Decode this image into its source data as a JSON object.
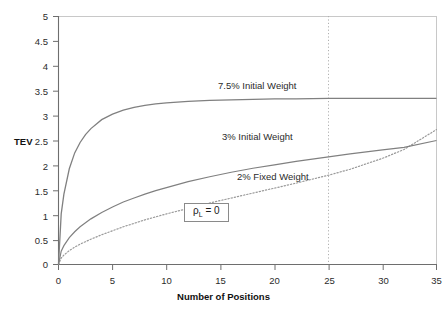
{
  "chart_data": {
    "type": "line",
    "title": "",
    "xlabel": "Number of Positions",
    "ylabel": "TEV",
    "xlim": [
      0,
      35
    ],
    "ylim": [
      0,
      5
    ],
    "xticks": [
      0,
      5,
      10,
      15,
      20,
      25,
      30,
      35
    ],
    "yticks": [
      0,
      0.5,
      1,
      1.5,
      2,
      2.5,
      3,
      3.5,
      4,
      4.5,
      5
    ],
    "xtick_labels": [
      "0",
      "5",
      "10",
      "15",
      "20",
      "25",
      "30",
      "35"
    ],
    "ytick_labels": [
      "0",
      "0.5",
      "1",
      "1.5",
      "2",
      "2.5",
      "3",
      "3.5",
      "4",
      "4.5",
      "5"
    ],
    "grid": false,
    "legend_position": "inline-annotations",
    "line_color": "#808080",
    "frame_color": "#c8c8c8",
    "axis_color": "#6e6e6e",
    "x": [
      0,
      0.25,
      0.5,
      1,
      1.5,
      2,
      2.5,
      3,
      4,
      5,
      6,
      7,
      8,
      9,
      10,
      12,
      14,
      16,
      18,
      20,
      22,
      25,
      27,
      30,
      32,
      35
    ],
    "series": [
      {
        "name": "7.5% Initial Weight",
        "style": "solid",
        "color": "#808080",
        "values": [
          0,
          1.02,
          1.42,
          1.93,
          2.25,
          2.46,
          2.62,
          2.74,
          2.92,
          3.03,
          3.11,
          3.17,
          3.21,
          3.24,
          3.26,
          3.29,
          3.31,
          3.32,
          3.33,
          3.34,
          3.34,
          3.35,
          3.35,
          3.35,
          3.35,
          3.35
        ],
        "annotation": "7.5% Initial Weight",
        "annotation_x": 17.5,
        "annotation_y": 3.55,
        "plateau_value": 3.35
      },
      {
        "name": "3% Initial Weight",
        "style": "solid",
        "color": "#808080",
        "values": [
          0,
          0.27,
          0.38,
          0.54,
          0.66,
          0.76,
          0.84,
          0.92,
          1.05,
          1.16,
          1.26,
          1.34,
          1.42,
          1.49,
          1.55,
          1.67,
          1.77,
          1.86,
          1.94,
          2.01,
          2.08,
          2.17,
          2.23,
          2.31,
          2.36,
          2.5
        ],
        "annotation": "3% Initial Weight",
        "annotation_x": 17.5,
        "annotation_y": 2.62,
        "end_value": 2.5
      },
      {
        "name": "2% Fixed Weight",
        "style": "dotted",
        "color": "#9a9a9a",
        "values": [
          0,
          0.13,
          0.19,
          0.28,
          0.35,
          0.41,
          0.46,
          0.51,
          0.6,
          0.68,
          0.76,
          0.83,
          0.9,
          0.96,
          1.02,
          1.13,
          1.24,
          1.34,
          1.44,
          1.54,
          1.64,
          1.8,
          1.92,
          2.14,
          2.32,
          2.72
        ],
        "annotation": "2% Fixed Weight",
        "annotation_x": 19.5,
        "annotation_y": 1.6,
        "end_value": 2.72
      }
    ],
    "reference_lines": [
      {
        "name": "x-25-reference",
        "orientation": "vertical",
        "value": 25,
        "style": "dotted",
        "color": "#b0b0b0"
      }
    ],
    "annotations": [
      {
        "name": "correlation-parameter",
        "text": "ρL = 0",
        "symbol": "ρ",
        "subscript": "L",
        "equals_value": "= 0",
        "boxed": true,
        "x": 13.0,
        "y": 0.98
      }
    ]
  }
}
